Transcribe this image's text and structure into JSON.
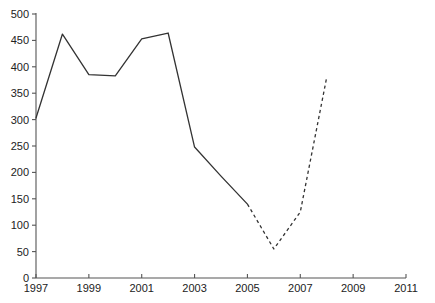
{
  "chart_data": {
    "type": "line",
    "title": "",
    "subtitle": "",
    "xlabel": "",
    "ylabel": "",
    "xlim": [
      1997,
      2011
    ],
    "ylim": [
      0,
      500
    ],
    "grid": false,
    "legend": false,
    "legend_position": "none",
    "x_ticks": [
      1997,
      1999,
      2001,
      2003,
      2005,
      2007,
      2009,
      2011
    ],
    "x_tick_labels": [
      "1997",
      "1999",
      "2001",
      "2003",
      "2005",
      "2007",
      "2009",
      "2011"
    ],
    "y_ticks": [
      0,
      50,
      100,
      150,
      200,
      250,
      300,
      350,
      400,
      450,
      500
    ],
    "y_tick_labels": [
      "0",
      "50",
      "100",
      "150",
      "200",
      "250",
      "300",
      "350",
      "400",
      "450",
      "500"
    ],
    "series": [
      {
        "name": "actual",
        "style": "solid",
        "color": "#333333",
        "x": [
          1997,
          1998,
          1999,
          2000,
          2001,
          2002,
          2003,
          2004,
          2005
        ],
        "values": [
          303,
          462,
          385,
          383,
          453,
          464,
          248,
          193,
          140
        ]
      },
      {
        "name": "projected",
        "style": "dashed",
        "color": "#333333",
        "x": [
          2005,
          2006,
          2007,
          2008
        ],
        "values": [
          140,
          55,
          125,
          380
        ]
      }
    ],
    "annotations": []
  },
  "axes_geometry": {
    "plot_left": 36,
    "plot_right": 406,
    "plot_top": 14,
    "plot_bottom": 278,
    "y_tick_len": 4,
    "x_tick_len": 4
  }
}
